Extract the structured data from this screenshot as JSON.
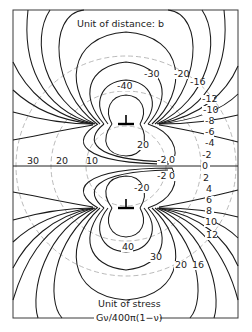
{
  "figure": {
    "title_top": "Unit of distance: b",
    "caption_line1": "Unit of stress",
    "caption_line2": "Gν/400π(1−ν)",
    "frame": {
      "x": 13,
      "y": 10,
      "width": 225,
      "height": 308
    },
    "center": {
      "x": 126,
      "y": 166
    },
    "colors": {
      "contour": "#1a1a1a",
      "dashed": "#a8a8a8",
      "frame": "#3a3a3a",
      "background": "#ffffff"
    }
  },
  "dislocations": [
    {
      "name": "upper-dislocation",
      "symbol": "⊥",
      "x": 126,
      "y": 124
    },
    {
      "name": "lower-dislocation",
      "symbol": "⊥",
      "x": 126,
      "y": 208
    }
  ],
  "distance_circles": [
    {
      "label": "10",
      "radius": 40
    },
    {
      "label": "20",
      "radius": 75
    },
    {
      "label": "30",
      "radius": 110
    }
  ],
  "axis_labels": {
    "l30": "30",
    "l20": "20",
    "l10": "10"
  },
  "contour_labels": {
    "upper": {
      "m40": "-40",
      "m30": "-30",
      "m20": "-20",
      "m16": "-16",
      "m12": "-12",
      "m10": "-10",
      "m8": "-8",
      "m6": "-6",
      "m4": "-4",
      "m2": "-2",
      "p20": "20",
      "m2_inner": "-2",
      "z_inner": "0"
    },
    "middle": {
      "zero": "0"
    },
    "lower": {
      "p40": "40",
      "p30": "30",
      "p20": "20",
      "p16": "16",
      "p12": "12",
      "p10": "10",
      "p8": "8",
      "p6": "6",
      "p4": "4",
      "p2": "2",
      "m20": "-20",
      "m2_inner": "-2",
      "z_inner": "0"
    }
  }
}
